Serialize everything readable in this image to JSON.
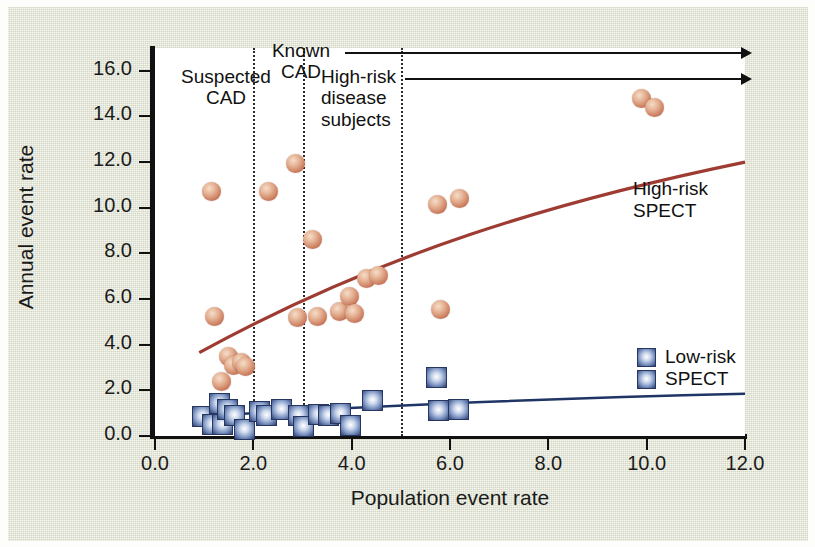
{
  "figure": {
    "background_color": "#e3e6d4",
    "plot_background": "#ffffff"
  },
  "chart_data": {
    "type": "scatter",
    "title": "",
    "xlabel": "Population event rate",
    "ylabel": "Annual event rate",
    "xlim": [
      0.0,
      12.0
    ],
    "ylim": [
      0.0,
      17.0
    ],
    "xticks": [
      "0.0",
      "2.0",
      "4.0",
      "6.0",
      "8.0",
      "10.0",
      "12.0"
    ],
    "xtick_values": [
      0.0,
      2.0,
      4.0,
      6.0,
      8.0,
      10.0,
      12.0
    ],
    "yticks": [
      "0.0",
      "2.0",
      "4.0",
      "6.0",
      "8.0",
      "10.0",
      "12.0",
      "14.0",
      "16.0"
    ],
    "ytick_values": [
      0.0,
      2.0,
      4.0,
      6.0,
      8.0,
      10.0,
      12.0,
      14.0,
      16.0
    ],
    "grid": false,
    "legend_position": "inside-right",
    "series": [
      {
        "name": "High-risk SPECT",
        "marker": "circle",
        "color": "#c9785a",
        "trend_color": "#9e3b32",
        "points": [
          [
            1.15,
            10.7
          ],
          [
            1.2,
            5.25
          ],
          [
            1.35,
            2.4
          ],
          [
            1.5,
            3.5
          ],
          [
            1.6,
            3.1
          ],
          [
            1.75,
            3.2
          ],
          [
            1.85,
            3.05
          ],
          [
            2.3,
            10.7
          ],
          [
            2.85,
            11.95
          ],
          [
            2.9,
            5.2
          ],
          [
            3.2,
            8.6
          ],
          [
            3.3,
            5.25
          ],
          [
            3.75,
            5.45
          ],
          [
            3.95,
            6.1
          ],
          [
            4.05,
            5.35
          ],
          [
            4.3,
            6.9
          ],
          [
            4.55,
            7.05
          ],
          [
            5.75,
            10.15
          ],
          [
            5.8,
            5.55
          ],
          [
            6.2,
            10.4
          ],
          [
            9.9,
            14.8
          ],
          [
            10.15,
            14.4
          ]
        ],
        "trend_x": [
          0.9,
          12.0
        ],
        "trend_y": [
          3.65,
          12.0
        ]
      },
      {
        "name": "Low-risk SPECT",
        "marker": "square",
        "color": "#2d3f74",
        "trend_color": "#1f3566",
        "points": [
          [
            0.95,
            0.9
          ],
          [
            1.15,
            0.55
          ],
          [
            1.3,
            1.45
          ],
          [
            1.35,
            0.55
          ],
          [
            1.45,
            1.2
          ],
          [
            1.6,
            0.95
          ],
          [
            1.8,
            0.35
          ],
          [
            2.1,
            1.1
          ],
          [
            2.25,
            0.95
          ],
          [
            2.55,
            1.2
          ],
          [
            2.9,
            0.95
          ],
          [
            3.0,
            0.45
          ],
          [
            3.3,
            1.0
          ],
          [
            3.5,
            0.95
          ],
          [
            3.75,
            1.05
          ],
          [
            3.95,
            0.5
          ],
          [
            4.4,
            1.6
          ],
          [
            5.7,
            2.6
          ],
          [
            5.75,
            1.15
          ],
          [
            6.15,
            1.2
          ]
        ],
        "trend_x": [
          0.9,
          12.0
        ],
        "trend_y": [
          0.85,
          1.85
        ]
      }
    ],
    "dividers": [
      {
        "x": 2.0,
        "style": "dotted"
      },
      {
        "x": 3.0,
        "style": "dotted"
      },
      {
        "x": 5.0,
        "style": "dotted"
      }
    ],
    "annotations": [
      {
        "name": "suspected-cad",
        "lines": [
          "Suspected",
          "CAD"
        ],
        "has_arrow": false
      },
      {
        "name": "known-cad",
        "lines": [
          "Known",
          "CAD"
        ],
        "has_arrow": true
      },
      {
        "name": "high-risk-disease-subjects",
        "lines": [
          "High-risk",
          "disease",
          "subjects"
        ],
        "has_arrow": true
      }
    ],
    "legend": [
      {
        "name": "high-risk-spect",
        "lines": [
          "High-risk",
          "SPECT"
        ],
        "marker": "line",
        "color": "#9e3b32"
      },
      {
        "name": "low-risk-spect",
        "lines": [
          "Low-risk",
          "SPECT"
        ],
        "marker": "square",
        "color": "#2d3f74"
      }
    ]
  }
}
